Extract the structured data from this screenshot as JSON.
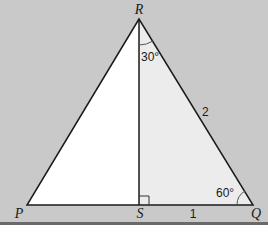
{
  "diagram": {
    "type": "geometry-triangle",
    "background_color": "#c8c8c8",
    "shaded_region_color": "#ececec",
    "unshaded_region_color": "#ffffff",
    "line_color": "#1a1a1a",
    "vertices": {
      "R": {
        "label": "R"
      },
      "P": {
        "label": "P"
      },
      "S": {
        "label": "S"
      },
      "Q": {
        "label": "Q"
      }
    },
    "angle_labels": {
      "angle_SRQ": "30°",
      "angle_RQS": "60°"
    },
    "side_labels": {
      "RQ": "2",
      "SQ": "1"
    },
    "right_angle_at": "S"
  }
}
